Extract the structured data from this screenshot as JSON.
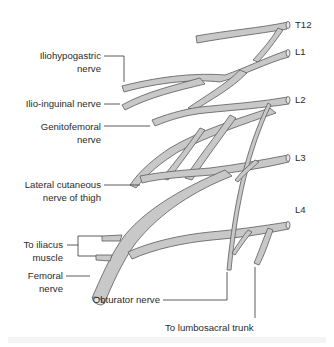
{
  "diagram": {
    "type": "anatomical-diagram",
    "colors": {
      "nerve_fill": "#c8c8c8",
      "nerve_stroke": "#5a5a5a",
      "leader_line": "#333333",
      "text": "#2b2b2b"
    },
    "roots": [
      {
        "id": "T12",
        "label": "T12"
      },
      {
        "id": "L1",
        "label": "L1"
      },
      {
        "id": "L2",
        "label": "L2"
      },
      {
        "id": "L3",
        "label": "L3"
      },
      {
        "id": "L4",
        "label": "L4"
      }
    ],
    "labels": {
      "iliohypogastric_1": "Iliohypogastric",
      "iliohypogastric_2": "nerve",
      "ilioinguinal": "Ilio-inguinal nerve",
      "genitofemoral_1": "Genitofemoral",
      "genitofemoral_2": "nerve",
      "lateral_cutaneous_1": "Lateral cutaneous",
      "lateral_cutaneous_2": "nerve of thigh",
      "iliacus_1": "To iliacus",
      "iliacus_2": "muscle",
      "femoral_1": "Femoral",
      "femoral_2": "nerve",
      "obturator": "Obturator nerve",
      "lumbosacral": "To lumbosacral trunk"
    }
  }
}
